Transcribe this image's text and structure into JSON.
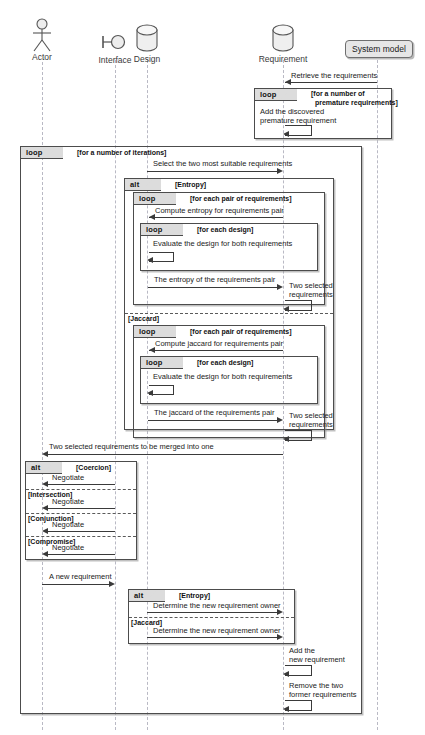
{
  "diagram": {
    "type": "uml-sequence-diagram",
    "width": 425,
    "height": 735
  },
  "participants": [
    {
      "id": "actor",
      "name": "Actor",
      "icon": "stick-figure-actor-icon",
      "x": 42
    },
    {
      "id": "interface",
      "name": "Interface",
      "icon": "interface-lollipop-icon",
      "x": 115
    },
    {
      "id": "design",
      "name": "Design",
      "icon": "database-cylinder-icon",
      "x": 147
    },
    {
      "id": "requirement",
      "name": "Requirement",
      "icon": "database-cylinder-icon",
      "x": 283
    },
    {
      "id": "systemmodel",
      "name": "System model",
      "icon": "rounded-box-icon",
      "x": 377
    }
  ],
  "fragments": [
    {
      "id": "frag-premature",
      "keyword": "loop",
      "guard": "[for a number of\n  premature requirements]"
    },
    {
      "id": "frag-iterations",
      "keyword": "loop",
      "guard": "[for a number of iterations]"
    },
    {
      "id": "frag-similarity",
      "keyword": "alt",
      "guard": "[Entropy]",
      "guard2": "[Jaccard]"
    },
    {
      "id": "frag-entropy-pairs",
      "keyword": "loop",
      "guard": "[for each pair of requirements]"
    },
    {
      "id": "frag-entropy-designs",
      "keyword": "loop",
      "guard": "[for each design]"
    },
    {
      "id": "frag-jaccard-pairs",
      "keyword": "loop",
      "guard": "[for each pair of requirements]"
    },
    {
      "id": "frag-jaccard-designs",
      "keyword": "loop",
      "guard": "[for each design]"
    },
    {
      "id": "frag-negotiation",
      "keyword": "alt",
      "guard": "[Coercion]",
      "guard2": "[Intersection]",
      "guard3": "[Conjunction]",
      "guard4": "[Compromise]"
    },
    {
      "id": "frag-owner",
      "keyword": "alt",
      "guard": "[Entropy]",
      "guard2": "[Jaccard]"
    }
  ],
  "messages": [
    {
      "id": "m1",
      "text": "Retrieve the requirements",
      "from": "systemmodel",
      "to": "requirement",
      "dir": "left"
    },
    {
      "id": "m2",
      "text": "Add the discovered\npremature requirement",
      "from": "requirement",
      "to": "requirement",
      "dir": "self"
    },
    {
      "id": "m3",
      "text": "Select the two most suitable requirements",
      "from": "design",
      "to": "requirement",
      "dir": "right"
    },
    {
      "id": "m4",
      "text": "Compute entropy for requirements pair",
      "from": "requirement",
      "to": "design",
      "dir": "left"
    },
    {
      "id": "m5",
      "text": "Evaluate the design for both requirements",
      "from": "design",
      "to": "design",
      "dir": "self"
    },
    {
      "id": "m6",
      "text": "The entropy of the requirements pair",
      "from": "design",
      "to": "requirement",
      "dir": "right"
    },
    {
      "id": "m7",
      "text": "Two selected\nrequirements",
      "from": "requirement",
      "to": "requirement",
      "dir": "self"
    },
    {
      "id": "m8",
      "text": "Compute jaccard for requirements pair",
      "from": "requirement",
      "to": "design",
      "dir": "left"
    },
    {
      "id": "m9",
      "text": "Evaluate the design for both requirements",
      "from": "design",
      "to": "design",
      "dir": "self"
    },
    {
      "id": "m10",
      "text": "The jaccard of the requirements pair",
      "from": "design",
      "to": "requirement",
      "dir": "right"
    },
    {
      "id": "m11",
      "text": "Two selected\nrequirements",
      "from": "requirement",
      "to": "requirement",
      "dir": "self"
    },
    {
      "id": "m12",
      "text": "Two selected requirements to be merged into one",
      "from": "requirement",
      "to": "actor",
      "dir": "left"
    },
    {
      "id": "m13",
      "text": "Negotiate",
      "from": "interface",
      "to": "actor",
      "dir": "left"
    },
    {
      "id": "m14",
      "text": "Negotiate",
      "from": "interface",
      "to": "actor",
      "dir": "left"
    },
    {
      "id": "m15",
      "text": "Negotiate",
      "from": "interface",
      "to": "actor",
      "dir": "left"
    },
    {
      "id": "m16",
      "text": "Negotiate",
      "from": "interface",
      "to": "actor",
      "dir": "left"
    },
    {
      "id": "m17",
      "text": "A new requirement",
      "from": "actor",
      "to": "interface",
      "dir": "right"
    },
    {
      "id": "m18",
      "text": "Determine the new requirement owner",
      "from": "design",
      "to": "requirement",
      "dir": "right"
    },
    {
      "id": "m19",
      "text": "Determine the new requirement owner",
      "from": "design",
      "to": "requirement",
      "dir": "right"
    },
    {
      "id": "m20",
      "text": "Add the\nnew requirement",
      "from": "requirement",
      "to": "requirement",
      "dir": "self"
    },
    {
      "id": "m21",
      "text": "Remove the two\nformer requirements",
      "from": "requirement",
      "to": "requirement",
      "dir": "self"
    }
  ],
  "colors": {
    "line": "#3a3a3a",
    "frame": "#4c4c4c",
    "lifeline": "#b9b9c4",
    "tab_fill": "#dcdcdc",
    "sysmodel_fill": "#e6e6e6",
    "text": "#1a1a1a"
  }
}
